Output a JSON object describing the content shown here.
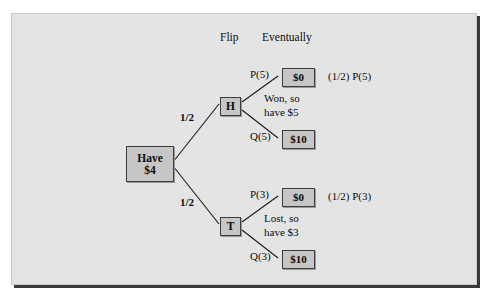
{
  "figure": {
    "type": "probability-tree-diagram",
    "background_color": "#e4e4e4",
    "node_fill_color": "#c6c6c6",
    "node_border_color": "#3d3d3d",
    "line_color": "#1a1a1a"
  },
  "column_headers": {
    "flip": "Flip",
    "eventually": "Eventually"
  },
  "root": {
    "line1": "Have",
    "line2": "$4"
  },
  "branches": [
    {
      "id": "heads",
      "edge_label": "1/2",
      "node_label": "H",
      "caption_line1": "Won, so",
      "caption_line2": "have $5",
      "outcomes": [
        {
          "id": "heads-p",
          "edge_label": "P(5)",
          "value": "$0",
          "annotation": "(1/2) P(5)"
        },
        {
          "id": "heads-q",
          "edge_label": "Q(5)",
          "value": "$10",
          "annotation": ""
        }
      ]
    },
    {
      "id": "tails",
      "edge_label": "1/2",
      "node_label": "T",
      "caption_line1": "Lost, so",
      "caption_line2": "have $3",
      "outcomes": [
        {
          "id": "tails-p",
          "edge_label": "P(3)",
          "value": "$0",
          "annotation": "(1/2) P(3)"
        },
        {
          "id": "tails-q",
          "edge_label": "Q(3)",
          "value": "$10",
          "annotation": ""
        }
      ]
    }
  ]
}
